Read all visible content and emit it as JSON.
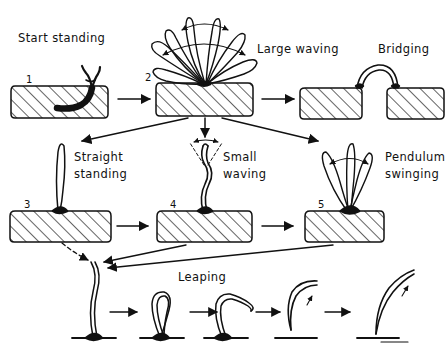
{
  "figure": {
    "title_visible": false,
    "background": "#ffffff",
    "ink": "#111111",
    "labels": {
      "start_standing": "Start  standing",
      "large_waving": "Large  waving",
      "bridging": "Bridging",
      "straight_standing_l1": "Straight",
      "straight_standing_l2": "standing",
      "small_waving_l1": "Small",
      "small_waving_l2": "waving",
      "pendulum_l1": "Pendulum",
      "pendulum_l2": "swinging",
      "leaping": "Leaping"
    },
    "panel_numbers": {
      "p1": "1",
      "p2": "2",
      "p3": "3",
      "p4": "4",
      "p5": "5"
    },
    "panels": [
      {
        "id": "p1",
        "number": "1",
        "label": "Start  standing",
        "row": 1
      },
      {
        "id": "p2",
        "number": "2",
        "label": "Large  waving",
        "row": 1
      },
      {
        "id": "p-bridge",
        "number": "",
        "label": "Bridging",
        "row": 1
      },
      {
        "id": "p3",
        "number": "3",
        "label": "Straight standing",
        "row": 2
      },
      {
        "id": "p4",
        "number": "4",
        "label": "Small waving",
        "row": 2
      },
      {
        "id": "p5",
        "number": "5",
        "label": "Pendulum swinging",
        "row": 2
      },
      {
        "id": "p-leap",
        "number": "",
        "label": "Leaping",
        "row": 3
      }
    ],
    "leaping_stages": 5
  }
}
